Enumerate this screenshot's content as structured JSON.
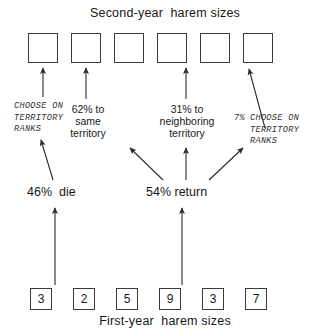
{
  "diagram": {
    "top_title": "Second-year  harem sizes",
    "bottom_caption": "First-year  harem sizes",
    "second_year_boxes": [
      {
        "value": "",
        "fed_by_arrow": true
      },
      {
        "value": "",
        "fed_by_arrow": true
      },
      {
        "value": "",
        "fed_by_arrow": false
      },
      {
        "value": "",
        "fed_by_arrow": true
      },
      {
        "value": "",
        "fed_by_arrow": false
      },
      {
        "value": "",
        "fed_by_arrow": true
      }
    ],
    "first_year_boxes": [
      {
        "value": "3"
      },
      {
        "value": "2"
      },
      {
        "value": "5"
      },
      {
        "value": "9"
      },
      {
        "value": "3"
      },
      {
        "value": "7"
      }
    ],
    "fate_labels": {
      "die": "46%  die",
      "return": "54% return"
    },
    "outcome_labels": [
      {
        "id": "choose-on-territory-ranks-left",
        "text": "CHOOSE ON\nTERRITORY\nRANKS",
        "style": "mono-italic"
      },
      {
        "id": "same-territory",
        "text": "62% to\nsame\nterritory",
        "style": "sans"
      },
      {
        "id": "neighboring-territory",
        "text": "31% to\nneighboring\nterritory",
        "style": "sans"
      },
      {
        "id": "choose-on-territory-ranks-right",
        "prefix": "7%",
        "text": "CHOOSE ON\nTERRITORY\nRANKS",
        "style": "mono-italic"
      }
    ],
    "colors": {
      "background": "#ffffff",
      "stroke": "#2b2b2b",
      "box_border": "#3b3b3b",
      "text": "#1a1a1a"
    }
  }
}
